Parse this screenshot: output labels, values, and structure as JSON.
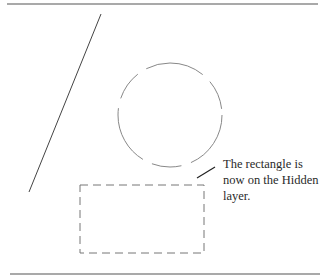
{
  "figure": {
    "callout": {
      "lines": [
        "The rectangle is",
        "now on the Hidden",
        "layer."
      ]
    },
    "shapes": {
      "top_rule": {
        "x1": 7,
        "y1": 4,
        "x2": 318,
        "y2": 4,
        "color": "#555555"
      },
      "bottom_rule": {
        "x1": 10,
        "y1": 274,
        "x2": 320,
        "y2": 274,
        "color": "#555555"
      },
      "diagonal_line": {
        "x1": 101,
        "y1": 14,
        "x2": 29,
        "y2": 192,
        "color": "#444444"
      },
      "circle": {
        "cx": 170,
        "cy": 115,
        "r": 52,
        "style": "dashed",
        "color": "#888888"
      },
      "rectangle": {
        "x": 80,
        "y": 185,
        "width": 124,
        "height": 68,
        "style": "dashed",
        "color": "#777777"
      },
      "leader_line": {
        "x1": 197,
        "y1": 178,
        "x2": 215,
        "y2": 167,
        "color": "#222222"
      }
    }
  }
}
